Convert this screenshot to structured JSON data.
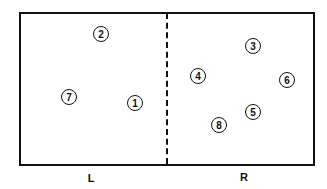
{
  "diagram": {
    "regions": [
      {
        "label": "L",
        "x": 91,
        "y": 178
      },
      {
        "label": "R",
        "x": 244,
        "y": 177
      }
    ],
    "nodes": [
      {
        "label": "1",
        "x": 135,
        "y": 103
      },
      {
        "label": "2",
        "x": 101,
        "y": 34
      },
      {
        "label": "3",
        "x": 253,
        "y": 46
      },
      {
        "label": "4",
        "x": 198,
        "y": 76
      },
      {
        "label": "5",
        "x": 253,
        "y": 112
      },
      {
        "label": "6",
        "x": 287,
        "y": 80
      },
      {
        "label": "7",
        "x": 69,
        "y": 97
      },
      {
        "label": "8",
        "x": 219,
        "y": 125
      }
    ]
  }
}
